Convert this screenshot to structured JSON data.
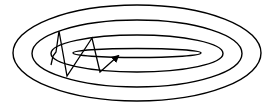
{
  "diagram": {
    "colors": {
      "background": "#ffffff",
      "stroke": "#000000"
    },
    "contours": [
      {
        "cx": 137,
        "cy": 53,
        "rx": 124,
        "ry": 48
      },
      {
        "cx": 137,
        "cy": 53.5,
        "rx": 105,
        "ry": 33.5
      },
      {
        "cx": 137,
        "cy": 53.5,
        "rx": 86,
        "ry": 18.5
      },
      {
        "cx": 137,
        "cy": 53,
        "rx": 64,
        "ry": 4.5
      }
    ],
    "path": {
      "points": [
        [
          51,
          65
        ],
        [
          53,
          56
        ],
        [
          56,
          52
        ],
        [
          59,
          31
        ],
        [
          67,
          76
        ],
        [
          92,
          38
        ],
        [
          100,
          72
        ],
        [
          118,
          56
        ]
      ],
      "has_arrowhead": true
    }
  }
}
